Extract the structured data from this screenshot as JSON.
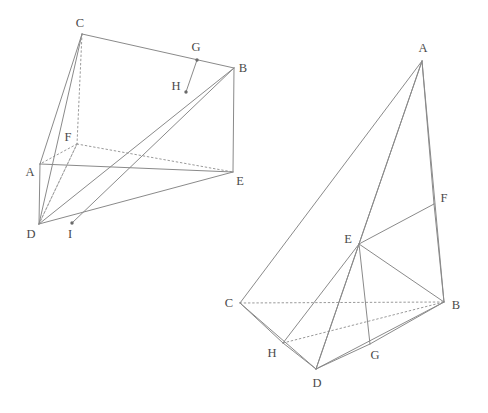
{
  "figure": {
    "canvas": {
      "width": 488,
      "height": 413
    },
    "style": {
      "background": "#ffffff",
      "stroke": "#8a8a8a",
      "stroke_dotted": "#9a9a9a",
      "label_color": "#4a4a4a",
      "stroke_width": 1.0,
      "dot_fill": "#6a6a6a",
      "font_size": 12.5
    }
  },
  "left_figure": {
    "name": "left-solid",
    "vertices": [
      {
        "id": "A",
        "label": "A",
        "x": 40,
        "y": 164,
        "label_x": 30,
        "label_y": 172,
        "dot": false
      },
      {
        "id": "B",
        "label": "B",
        "x": 234,
        "y": 68,
        "label_x": 243,
        "label_y": 68,
        "dot": false
      },
      {
        "id": "C",
        "label": "C",
        "x": 82,
        "y": 34,
        "label_x": 80,
        "label_y": 23,
        "dot": false
      },
      {
        "id": "D",
        "label": "D",
        "x": 39,
        "y": 224,
        "label_x": 31,
        "label_y": 234,
        "dot": false
      },
      {
        "id": "E",
        "label": "E",
        "x": 233,
        "y": 172,
        "label_x": 240,
        "label_y": 181,
        "dot": false
      },
      {
        "id": "F",
        "label": "F",
        "x": 77,
        "y": 144,
        "label_x": 68,
        "label_y": 137,
        "dot": false
      },
      {
        "id": "G",
        "label": "G",
        "x": 197,
        "y": 60,
        "label_x": 196,
        "label_y": 47,
        "dot": true
      },
      {
        "id": "H",
        "label": "H",
        "x": 186,
        "y": 92,
        "label_x": 176,
        "label_y": 86,
        "dot": true
      },
      {
        "id": "I",
        "label": "I",
        "x": 72,
        "y": 223,
        "label_x": 70,
        "label_y": 234,
        "dot": true
      }
    ],
    "edges_solid": [
      [
        "C",
        "B"
      ],
      [
        "C",
        "A"
      ],
      [
        "C",
        "D"
      ],
      [
        "A",
        "D"
      ],
      [
        "A",
        "E"
      ],
      [
        "B",
        "E"
      ],
      [
        "B",
        "D"
      ],
      [
        "B",
        "I"
      ],
      [
        "D",
        "E"
      ],
      [
        "G",
        "H"
      ]
    ],
    "edges_dotted": [
      [
        "C",
        "F"
      ],
      [
        "F",
        "D"
      ],
      [
        "F",
        "E"
      ],
      [
        "F",
        "A"
      ],
      [
        "D",
        "F"
      ]
    ],
    "notes": "F is hidden back-bottom-left corner; G on CB, H on BD, I on DE."
  },
  "right_figure": {
    "name": "right-solid",
    "vertices": [
      {
        "id": "A",
        "label": "A",
        "x": 422,
        "y": 61,
        "label_x": 423,
        "label_y": 48,
        "dot": false
      },
      {
        "id": "B",
        "label": "B",
        "x": 444,
        "y": 302,
        "label_x": 456,
        "label_y": 305,
        "dot": false
      },
      {
        "id": "C",
        "label": "C",
        "x": 240,
        "y": 303,
        "label_x": 229,
        "label_y": 303,
        "dot": false
      },
      {
        "id": "D",
        "label": "D",
        "x": 316,
        "y": 369,
        "label_x": 317,
        "label_y": 383,
        "dot": false
      },
      {
        "id": "E",
        "label": "E",
        "x": 359,
        "y": 244,
        "label_x": 348,
        "label_y": 239,
        "dot": false
      },
      {
        "id": "F",
        "label": "F",
        "x": 434,
        "y": 204,
        "label_x": 444,
        "label_y": 198,
        "dot": false
      },
      {
        "id": "G",
        "label": "G",
        "x": 370,
        "y": 344,
        "label_x": 375,
        "label_y": 355,
        "dot": false
      },
      {
        "id": "H",
        "label": "H",
        "x": 283,
        "y": 343,
        "label_x": 272,
        "label_y": 353,
        "dot": false
      }
    ],
    "edges_solid": [
      [
        "A",
        "C"
      ],
      [
        "A",
        "D"
      ],
      [
        "A",
        "B"
      ],
      [
        "A",
        "F"
      ],
      [
        "A",
        "E"
      ],
      [
        "C",
        "H"
      ],
      [
        "C",
        "D"
      ],
      [
        "H",
        "D"
      ],
      [
        "H",
        "E"
      ],
      [
        "D",
        "G"
      ],
      [
        "D",
        "B"
      ],
      [
        "D",
        "E"
      ],
      [
        "G",
        "B"
      ],
      [
        "G",
        "E"
      ],
      [
        "E",
        "F"
      ],
      [
        "E",
        "B"
      ],
      [
        "F",
        "B"
      ]
    ],
    "edges_dotted": [
      [
        "C",
        "B"
      ],
      [
        "H",
        "B"
      ]
    ],
    "notes": "C-B and H-B are hidden edges; E interior apex joined to F,B,G,D,H."
  }
}
